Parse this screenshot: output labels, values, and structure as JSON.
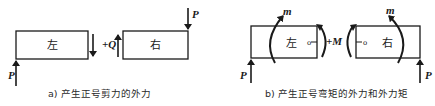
{
  "panel_a": {
    "left_box_label": "左",
    "right_box_label": "右",
    "force_left": "P",
    "force_right": "P",
    "shear_label": "+Q",
    "caption": "a) 产生正号剪力的外力"
  },
  "panel_b": {
    "left_box_label": "左",
    "right_box_label": "右",
    "force_left": "P",
    "force_right": "P",
    "moment_left": "m",
    "moment_right": "m",
    "bending_label": "+M",
    "center_mark_left": "o",
    "center_mark_right": "o",
    "caption": "b) 产生正号弯矩的外力和外力矩"
  },
  "colors": {
    "stroke": "#1a1a1a",
    "background": "#ffffff"
  }
}
